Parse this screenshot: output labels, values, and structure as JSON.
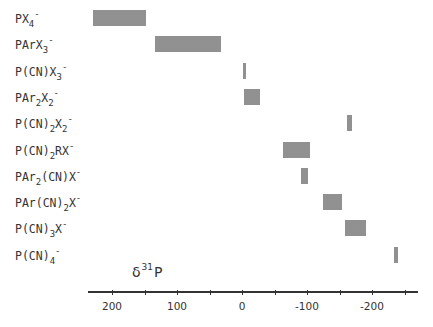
{
  "chart_data": {
    "type": "bar",
    "subtype": "horizontal-range",
    "title": "",
    "xlabel": "δ31P",
    "xlabel_parts": {
      "symbol": "δ",
      "superscript": "31",
      "element": "P"
    },
    "ylabel": "",
    "x_reversed": true,
    "xlim": [
      250,
      -270
    ],
    "x_ticks_major": [
      200,
      100,
      0,
      -100,
      -200
    ],
    "x_ticks_minor": [
      150,
      50,
      -50,
      -150,
      -250
    ],
    "x_tick_labels": [
      "200",
      "100",
      "0",
      "-100",
      "-200"
    ],
    "grid": false,
    "legend": null,
    "categories": [
      "PX4-",
      "PArX3-",
      "P(CN)X3-",
      "PAr2X2-",
      "P(CN)2X2-",
      "P(CN)2RX-",
      "PAr2(CN)X-",
      "PAr(CN)2X-",
      "P(CN)3X-",
      "P(CN)4-"
    ],
    "ranges": [
      {
        "label": "PX4-",
        "from": 230,
        "to": 148
      },
      {
        "label": "PArX3-",
        "from": 134,
        "to": 32
      },
      {
        "label": "P(CN)X3-",
        "from": -2,
        "to": -6
      },
      {
        "label": "PAr2X2-",
        "from": -3,
        "to": -28
      },
      {
        "label": "P(CN)2X2-",
        "from": -162,
        "to": -169
      },
      {
        "label": "P(CN)2RX-",
        "from": -63,
        "to": -105
      },
      {
        "label": "PAr2(CN)X-",
        "from": -91,
        "to": -102
      },
      {
        "label": "PAr(CN)2X-",
        "from": -125,
        "to": -154
      },
      {
        "label": "P(CN)3X-",
        "from": -158,
        "to": -191
      },
      {
        "label": "P(CN)4-",
        "from": -234,
        "to": -240
      }
    ]
  },
  "labels": [
    {
      "parts": [
        [
          "t",
          "PX"
        ],
        [
          "sub",
          "4"
        ],
        [
          "sup",
          "-"
        ]
      ]
    },
    {
      "parts": [
        [
          "t",
          "PArX"
        ],
        [
          "sub",
          "3"
        ],
        [
          "sup",
          "-"
        ]
      ]
    },
    {
      "parts": [
        [
          "t",
          "P(CN)X"
        ],
        [
          "sub",
          "3"
        ],
        [
          "sup",
          "-"
        ]
      ]
    },
    {
      "parts": [
        [
          "t",
          "PAr"
        ],
        [
          "sub",
          "2"
        ],
        [
          "t",
          "X"
        ],
        [
          "sub",
          "2"
        ],
        [
          "sup",
          "-"
        ]
      ]
    },
    {
      "parts": [
        [
          "t",
          "P(CN)"
        ],
        [
          "sub",
          "2"
        ],
        [
          "t",
          "X"
        ],
        [
          "sub",
          "2"
        ],
        [
          "sup",
          "-"
        ]
      ]
    },
    {
      "parts": [
        [
          "t",
          "P(CN)"
        ],
        [
          "sub",
          "2"
        ],
        [
          "t",
          "RX"
        ],
        [
          "sup",
          "-"
        ]
      ]
    },
    {
      "parts": [
        [
          "t",
          "PAr"
        ],
        [
          "sub",
          "2"
        ],
        [
          "t",
          "(CN)X"
        ],
        [
          "sup",
          "-"
        ]
      ]
    },
    {
      "parts": [
        [
          "t",
          "PAr(CN)"
        ],
        [
          "sub",
          "2"
        ],
        [
          "t",
          "X"
        ],
        [
          "sup",
          "-"
        ]
      ]
    },
    {
      "parts": [
        [
          "t",
          "P(CN)"
        ],
        [
          "sub",
          "3"
        ],
        [
          "t",
          "X"
        ],
        [
          "sup",
          "-"
        ]
      ]
    },
    {
      "parts": [
        [
          "t",
          "P(CN)"
        ],
        [
          "sub",
          "4"
        ],
        [
          "sup",
          "-"
        ]
      ]
    }
  ],
  "axis": {
    "title_symbol": "δ",
    "title_sup": "31",
    "title_element": "P"
  },
  "colors": {
    "bar_fill": "#c8c8c8",
    "bar_dots": "#8f8f8f",
    "axis": "#333333",
    "text": "#333333"
  }
}
